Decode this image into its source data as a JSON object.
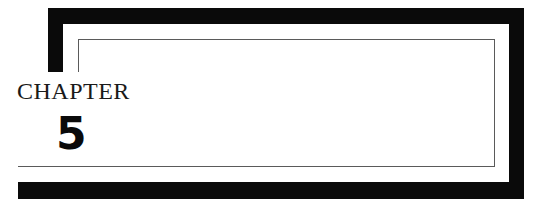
{
  "chapter": {
    "label": "CHAPTER",
    "number": "5"
  },
  "colors": {
    "frame": "#0a0a0a",
    "rule": "#5a5a5a",
    "background": "#ffffff"
  }
}
